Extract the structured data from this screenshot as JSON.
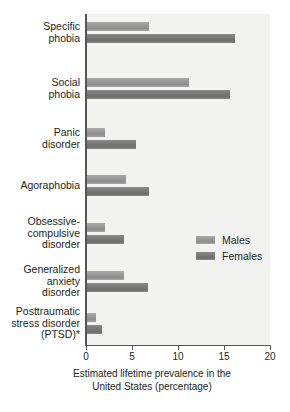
{
  "chart_data": {
    "type": "bar",
    "orientation": "horizontal",
    "title": "",
    "xlabel": "Estimated lifetime prevalence in the United States (percentage)",
    "xlabel_line1": "Estimated lifetime prevalence in the",
    "xlabel_line2": "United States (percentage)",
    "ylabel": "",
    "xlim": [
      0,
      20
    ],
    "xticks": [
      0,
      5,
      10,
      15,
      20
    ],
    "xtick_labels": [
      "0",
      "5",
      "10",
      "15",
      "20"
    ],
    "grid": false,
    "legend_position": "middle-right",
    "categories": [
      "Specific phobia",
      "Social phobia",
      "Panic disorder",
      "Agoraphobia",
      "Obsessive-compulsive disorder",
      "Generalized anxiety disorder",
      "Posttraumatic stress disorder (PTSD)*"
    ],
    "category_label_lines": [
      [
        "Specific",
        "phobia"
      ],
      [
        "Social",
        "phobia"
      ],
      [
        "Panic",
        "disorder"
      ],
      [
        "Agoraphobia"
      ],
      [
        "Obsessive-",
        "compulsive",
        "disorder"
      ],
      [
        "Generalized",
        "anxiety",
        "disorder"
      ],
      [
        "Posttraumatic",
        "stress disorder",
        "(PTSD)*"
      ]
    ],
    "series": [
      {
        "name": "Males",
        "color": "#9b9b9b",
        "values": [
          6.7,
          11.1,
          2.0,
          4.2,
          2.0,
          4.0,
          1.0
        ]
      },
      {
        "name": "Females",
        "color": "#7b7b7b",
        "values": [
          16.1,
          15.5,
          5.3,
          6.7,
          4.0,
          6.6,
          1.6
        ]
      }
    ]
  },
  "legend": {
    "items": [
      {
        "label": "Males"
      },
      {
        "label": "Females"
      }
    ]
  },
  "colors": {
    "males": "#9b9b9b",
    "females": "#7b7b7b",
    "plot_background": "#f2f2f0",
    "axis": "#555555",
    "text": "#231f20"
  }
}
